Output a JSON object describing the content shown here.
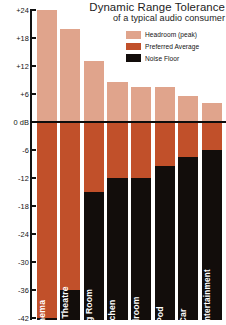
{
  "title": {
    "main": "Dynamic Range Tolerance",
    "sub": "of a typical audio consumer"
  },
  "legend": {
    "position": "top-right",
    "items": [
      {
        "label": "Headroom (peak)",
        "color": "#e0a48c"
      },
      {
        "label": "Preferred Average",
        "color": "#c1502a"
      },
      {
        "label": "Noise Floor",
        "color": "#120d0b"
      }
    ]
  },
  "axis": {
    "unit": "dB",
    "ticks": [
      {
        "value": 24,
        "label": "+24"
      },
      {
        "value": 18,
        "label": "+18"
      },
      {
        "value": 12,
        "label": "+12"
      },
      {
        "value": 6,
        "label": "+6"
      },
      {
        "value": 0,
        "label": "0 dB"
      },
      {
        "value": -6,
        "label": "-6"
      },
      {
        "value": -12,
        "label": "-12"
      },
      {
        "value": -18,
        "label": "-18"
      },
      {
        "value": -24,
        "label": "-24"
      },
      {
        "value": -30,
        "label": "-30"
      },
      {
        "value": -36,
        "label": "-36"
      },
      {
        "value": -42,
        "label": "-42"
      }
    ]
  },
  "chart_data": {
    "type": "bar",
    "title": "Dynamic Range Tolerance",
    "subtitle": "of a typical audio consumer",
    "xlabel": "",
    "ylabel": "dB",
    "ylim": [
      -42,
      24
    ],
    "grid": false,
    "legend_position": "top-right",
    "categories": [
      "Cinema",
      "Home Theatre",
      "Living Room",
      "Kitchen",
      "Bedroom",
      "iPod",
      "Car",
      "In Flight Entertainment"
    ],
    "series": [
      {
        "name": "Headroom (peak)",
        "color": "#e0a48c",
        "description": "Top of bar above 0 dB",
        "values": [
          24,
          20,
          13,
          8.5,
          7.5,
          7.5,
          5.5,
          4
        ]
      },
      {
        "name": "Preferred Average",
        "color": "#c1502a",
        "description": "Region from 0 dB down to the noise floor",
        "values": [
          0,
          0,
          0,
          0,
          0,
          0,
          0,
          0
        ]
      },
      {
        "name": "Noise Floor",
        "color": "#120d0b",
        "description": "Top of the black noise-floor region, in dB",
        "values": [
          -42,
          -36,
          -15,
          -12,
          -12,
          -9.5,
          -7.5,
          -6
        ]
      }
    ]
  }
}
